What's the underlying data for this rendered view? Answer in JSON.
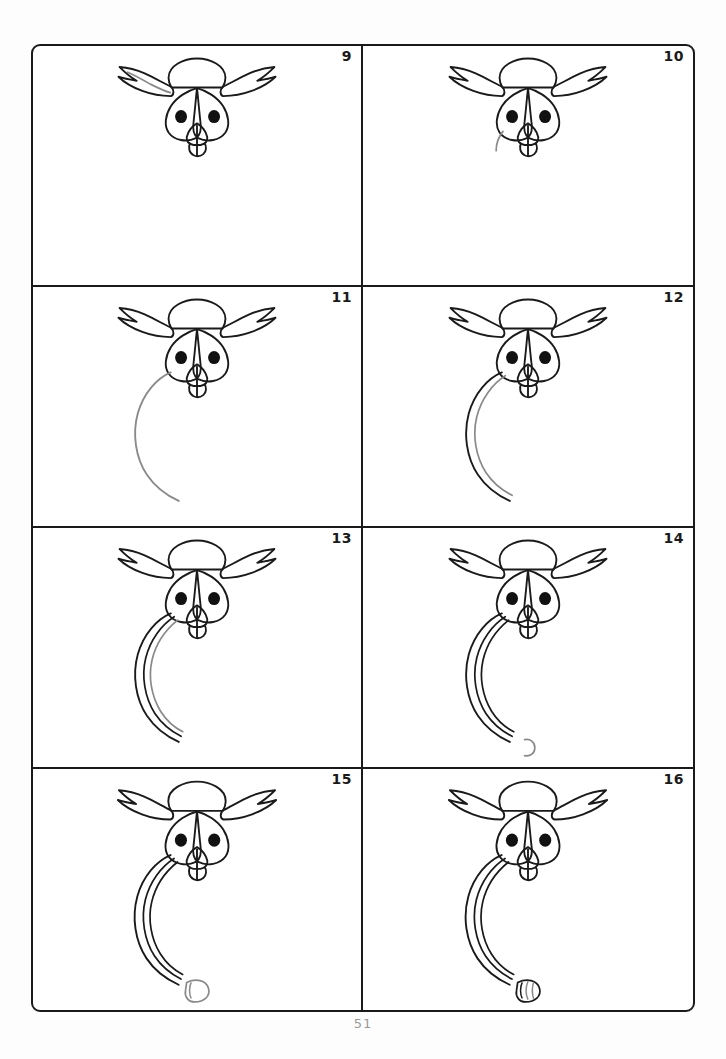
{
  "page": {
    "page_number": "51",
    "tutorial_type": "step-by-step-drawing-grid",
    "grid": {
      "columns": 2,
      "rows": 4,
      "panel_count": 8
    },
    "ink_colors": {
      "existing_line": "#1a1a1a",
      "new_step_line": "#8a8a8a",
      "pupil_fill": "#111111",
      "border": "#1a1a1a",
      "page_number": "#9a9a9a",
      "paper": "#ffffff"
    }
  },
  "panels": [
    {
      "number": "9",
      "name": "panel-step-9",
      "new_stroke_label": "left ear tuft feather highlight",
      "parts_black": [
        "head",
        "left-ear-tuft",
        "right-ear-tuft",
        "left-eye",
        "right-eye",
        "left-pupil",
        "right-pupil",
        "beak",
        "brow"
      ],
      "parts_gray": [
        "ear-tuft-inner-feather"
      ]
    },
    {
      "number": "10",
      "name": "panel-step-10",
      "new_stroke_label": "short throat start stroke",
      "parts_black": [
        "head",
        "left-ear-tuft",
        "right-ear-tuft",
        "left-eye",
        "right-eye",
        "left-pupil",
        "right-pupil",
        "beak",
        "brow"
      ],
      "parts_gray": [
        "throat-start"
      ]
    },
    {
      "number": "11",
      "name": "panel-step-11",
      "new_stroke_label": "long back and body curve",
      "parts_black": [
        "head",
        "ear-tufts",
        "eyes",
        "pupils",
        "beak",
        "brow"
      ],
      "parts_gray": [
        "body-back-curve"
      ]
    },
    {
      "number": "12",
      "name": "panel-step-12",
      "new_stroke_label": "first wing feather along body",
      "parts_black": [
        "head",
        "ear-tufts",
        "eyes",
        "pupils",
        "beak",
        "brow",
        "body-back-curve"
      ],
      "parts_gray": [
        "wing-feather-1"
      ]
    },
    {
      "number": "13",
      "name": "panel-step-13",
      "new_stroke_label": "second wing feather",
      "parts_black": [
        "head",
        "ear-tufts",
        "eyes",
        "pupils",
        "beak",
        "brow",
        "body-back-curve",
        "wing-feather-1"
      ],
      "parts_gray": [
        "wing-feather-2"
      ]
    },
    {
      "number": "14",
      "name": "panel-step-14",
      "new_stroke_label": "small foot hook outline",
      "parts_black": [
        "head",
        "ear-tufts",
        "eyes",
        "pupils",
        "beak",
        "brow",
        "body-back-curve",
        "wing-feather-1",
        "wing-feather-2"
      ],
      "parts_gray": [
        "foot-hook"
      ]
    },
    {
      "number": "15",
      "name": "panel-step-15",
      "new_stroke_label": "foot pad and first toe",
      "parts_black": [
        "head",
        "ear-tufts",
        "eyes",
        "pupils",
        "beak",
        "brow",
        "body-back-curve",
        "wing-feather-1",
        "wing-feather-2"
      ],
      "parts_gray": [
        "foot-pad",
        "toe-1"
      ]
    },
    {
      "number": "16",
      "name": "panel-step-16",
      "new_stroke_label": "remaining toes completed",
      "parts_black": [
        "head",
        "ear-tufts",
        "eyes",
        "pupils",
        "beak",
        "brow",
        "body-back-curve",
        "wing-feather-1",
        "wing-feather-2",
        "foot-pad"
      ],
      "parts_gray": [
        "toe-2",
        "toe-3"
      ]
    }
  ]
}
